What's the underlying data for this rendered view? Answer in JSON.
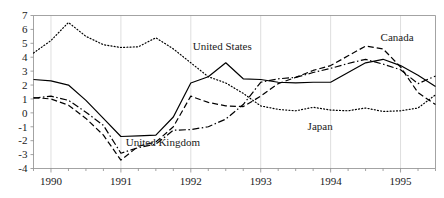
{
  "chart_data": {
    "type": "line",
    "title": "",
    "subtitle": "",
    "xlabel": "",
    "ylabel": "",
    "xlim": [
      1989.75,
      1995.5
    ],
    "ylim": [
      -4,
      7
    ],
    "yticks": [
      "7",
      "6",
      "5",
      "4",
      "3",
      "2",
      "1",
      "0",
      "-1",
      "-2",
      "-3",
      "-4"
    ],
    "ytick_values": [
      7,
      6,
      5,
      4,
      3,
      2,
      1,
      0,
      -1,
      -2,
      -3,
      -4
    ],
    "xticks": [
      "1990",
      "1991",
      "1992",
      "1993",
      "1994",
      "1995"
    ],
    "xtick_values": [
      1990,
      1991,
      1992,
      1993,
      1994,
      1995
    ],
    "grid": "vertical-faint",
    "legend": "inline-annotations",
    "x": [
      1989.75,
      1990.0,
      1990.25,
      1990.5,
      1990.75,
      1991.0,
      1991.25,
      1991.5,
      1991.75,
      1992.0,
      1992.25,
      1992.5,
      1992.75,
      1993.0,
      1993.25,
      1993.5,
      1993.75,
      1994.0,
      1994.25,
      1994.5,
      1994.75,
      1995.0,
      1995.25,
      1995.5
    ],
    "series": [
      {
        "name": "United States",
        "style": "solid",
        "color": "#000000",
        "label_x": 1992.45,
        "label_y": 4.55,
        "values": [
          2.4,
          2.3,
          2.0,
          0.9,
          -0.4,
          -1.7,
          -1.65,
          -1.6,
          -0.3,
          2.15,
          2.6,
          3.6,
          2.45,
          2.4,
          2.2,
          2.15,
          2.2,
          2.2,
          2.9,
          3.6,
          3.85,
          3.4,
          2.7,
          1.9
        ]
      },
      {
        "name": "United Kingdom",
        "style": "dotted",
        "color": "#000000",
        "label_x": 1991.6,
        "label_y": -2.35,
        "values": [
          4.3,
          5.2,
          6.5,
          5.5,
          4.9,
          4.7,
          4.75,
          5.4,
          4.6,
          3.6,
          2.6,
          2.15,
          1.4,
          0.5,
          0.25,
          0.15,
          0.4,
          0.2,
          0.15,
          0.35,
          0.1,
          0.15,
          0.35,
          1.3
        ]
      },
      {
        "name": "Japan",
        "style": "dashed",
        "color": "#000000",
        "label_x": 1993.85,
        "label_y": -1.25,
        "values": [
          1.1,
          1.0,
          0.55,
          -0.4,
          -1.6,
          -3.4,
          -2.4,
          -2.1,
          -1.0,
          1.2,
          0.75,
          0.5,
          0.45,
          1.2,
          2.1,
          2.55,
          3.05,
          3.4,
          4.1,
          4.8,
          4.6,
          3.3,
          1.45,
          0.6
        ]
      },
      {
        "name": "Canada",
        "style": "dashdot",
        "color": "#000000",
        "label_x": 1994.95,
        "label_y": 5.15,
        "values": [
          1.05,
          1.2,
          0.9,
          0.05,
          -0.9,
          -2.9,
          -2.5,
          -2.25,
          -1.25,
          -1.2,
          -1.0,
          -0.45,
          0.6,
          2.2,
          2.45,
          2.55,
          2.9,
          3.2,
          3.55,
          3.85,
          3.5,
          3.1,
          2.1,
          2.65
        ]
      }
    ],
    "annotations": [
      {
        "text": "United States",
        "x": 1992.45,
        "y": 4.55
      },
      {
        "text": "United Kingdom",
        "x": 1991.6,
        "y": -2.35
      },
      {
        "text": "Japan",
        "x": 1993.85,
        "y": -1.25
      },
      {
        "text": "Canada",
        "x": 1994.95,
        "y": 5.15
      }
    ]
  }
}
